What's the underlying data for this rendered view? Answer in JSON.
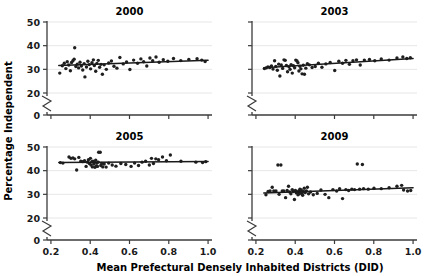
{
  "figure": {
    "xlabel": "Mean Prefectural Densely Inhabited Districts (DID)",
    "ylabel": "Percentage Independent",
    "xtick_labels": [
      "0.2",
      "0.4",
      "0.6",
      "0.8",
      "1.0"
    ],
    "ytick_labels": [
      "0",
      "20",
      "30",
      "40",
      "50"
    ],
    "axis_break": true,
    "colors": {
      "point": "#1f1f1f",
      "fitline": "#1a1a1a",
      "grid": "#e3e3e3",
      "axis": "#3b3b3b",
      "background": "#ffffff"
    }
  },
  "chart_data": [
    {
      "type": "scatter",
      "title": "2000",
      "xlabel": "Mean Prefectural Densely Inhabited Districts (DID)",
      "ylabel": "Percentage Independent",
      "xlim": [
        0.18,
        1.02
      ],
      "ylim": [
        20,
        50
      ],
      "yticks": [
        20,
        30,
        40,
        50
      ],
      "xticks": [
        0.2,
        0.4,
        0.6,
        0.8,
        1.0
      ],
      "grid": true,
      "legend": "none",
      "points": [
        [
          0.245,
          28.4
        ],
        [
          0.258,
          31.5
        ],
        [
          0.268,
          32.6
        ],
        [
          0.276,
          30.3
        ],
        [
          0.283,
          33.2
        ],
        [
          0.291,
          31.8
        ],
        [
          0.299,
          29.4
        ],
        [
          0.305,
          32.9
        ],
        [
          0.312,
          33.6
        ],
        [
          0.318,
          34.3
        ],
        [
          0.321,
          39.1
        ],
        [
          0.327,
          31.2
        ],
        [
          0.334,
          32.2
        ],
        [
          0.341,
          30.6
        ],
        [
          0.348,
          33.0
        ],
        [
          0.355,
          31.4
        ],
        [
          0.362,
          29.7
        ],
        [
          0.369,
          32.4
        ],
        [
          0.373,
          26.8
        ],
        [
          0.381,
          31.0
        ],
        [
          0.388,
          33.4
        ],
        [
          0.395,
          32.0
        ],
        [
          0.402,
          30.2
        ],
        [
          0.409,
          32.8
        ],
        [
          0.416,
          34.0
        ],
        [
          0.421,
          31.6
        ],
        [
          0.428,
          29.2
        ],
        [
          0.434,
          32.5
        ],
        [
          0.441,
          33.8
        ],
        [
          0.448,
          30.9
        ],
        [
          0.455,
          32.1
        ],
        [
          0.462,
          27.9
        ],
        [
          0.471,
          31.9
        ],
        [
          0.482,
          30.0
        ],
        [
          0.494,
          32.7
        ],
        [
          0.508,
          33.5
        ],
        [
          0.521,
          31.3
        ],
        [
          0.536,
          30.5
        ],
        [
          0.551,
          35.0
        ],
        [
          0.568,
          32.3
        ],
        [
          0.585,
          33.1
        ],
        [
          0.602,
          29.9
        ],
        [
          0.621,
          33.9
        ],
        [
          0.641,
          32.6
        ],
        [
          0.658,
          34.4
        ],
        [
          0.672,
          33.2
        ],
        [
          0.688,
          31.4
        ],
        [
          0.704,
          34.8
        ],
        [
          0.718,
          33.6
        ],
        [
          0.735,
          35.2
        ],
        [
          0.751,
          33.0
        ],
        [
          0.772,
          34.1
        ],
        [
          0.795,
          33.4
        ],
        [
          0.824,
          34.6
        ],
        [
          0.861,
          33.7
        ],
        [
          0.902,
          34.2
        ],
        [
          0.944,
          34.5
        ],
        [
          0.968,
          33.9
        ],
        [
          0.985,
          33.3
        ]
      ],
      "fit_line": {
        "x0": 0.24,
        "y0": 31.6,
        "x1": 1.0,
        "y1": 33.8
      }
    },
    {
      "type": "scatter",
      "title": "2003",
      "xlabel": "Mean Prefectural Densely Inhabited Districts (DID)",
      "ylabel": "Percentage Independent",
      "xlim": [
        0.18,
        1.02
      ],
      "ylim": [
        20,
        50
      ],
      "yticks": [
        20,
        30,
        40,
        50
      ],
      "xticks": [
        0.2,
        0.4,
        0.6,
        0.8,
        1.0
      ],
      "grid": true,
      "legend": "none",
      "points": [
        [
          0.243,
          30.3
        ],
        [
          0.252,
          30.6
        ],
        [
          0.261,
          31.0
        ],
        [
          0.271,
          30.8
        ],
        [
          0.279,
          31.4
        ],
        [
          0.287,
          30.1
        ],
        [
          0.295,
          33.6
        ],
        [
          0.301,
          31.2
        ],
        [
          0.309,
          29.6
        ],
        [
          0.316,
          32.2
        ],
        [
          0.322,
          27.2
        ],
        [
          0.329,
          31.8
        ],
        [
          0.336,
          30.4
        ],
        [
          0.343,
          34.0
        ],
        [
          0.349,
          33.8
        ],
        [
          0.355,
          31.6
        ],
        [
          0.361,
          29.0
        ],
        [
          0.368,
          31.1
        ],
        [
          0.374,
          30.0
        ],
        [
          0.379,
          32.0
        ],
        [
          0.385,
          28.4
        ],
        [
          0.391,
          31.5
        ],
        [
          0.397,
          30.7
        ],
        [
          0.403,
          33.9
        ],
        [
          0.409,
          33.5
        ],
        [
          0.414,
          32.8
        ],
        [
          0.419,
          29.3
        ],
        [
          0.424,
          31.3
        ],
        [
          0.429,
          30.2
        ],
        [
          0.435,
          28.1
        ],
        [
          0.441,
          31.7
        ],
        [
          0.447,
          27.9
        ],
        [
          0.454,
          30.5
        ],
        [
          0.462,
          32.4
        ],
        [
          0.472,
          31.9
        ],
        [
          0.486,
          30.8
        ],
        [
          0.502,
          31.2
        ],
        [
          0.518,
          32.6
        ],
        [
          0.536,
          30.9
        ],
        [
          0.556,
          32.3
        ],
        [
          0.578,
          32.9
        ],
        [
          0.601,
          29.5
        ],
        [
          0.622,
          33.4
        ],
        [
          0.641,
          32.6
        ],
        [
          0.658,
          33.8
        ],
        [
          0.676,
          32.1
        ],
        [
          0.694,
          33.6
        ],
        [
          0.712,
          34.0
        ],
        [
          0.731,
          31.8
        ],
        [
          0.752,
          33.9
        ],
        [
          0.778,
          34.2
        ],
        [
          0.805,
          33.6
        ],
        [
          0.838,
          34.4
        ],
        [
          0.878,
          33.9
        ],
        [
          0.918,
          34.8
        ],
        [
          0.948,
          35.2
        ],
        [
          0.968,
          34.6
        ],
        [
          0.986,
          34.9
        ]
      ],
      "fit_line": {
        "x0": 0.24,
        "y0": 30.7,
        "x1": 1.0,
        "y1": 34.6
      }
    },
    {
      "type": "scatter",
      "title": "2005",
      "xlabel": "Mean Prefectural Densely Inhabited Districts (DID)",
      "ylabel": "Percentage Independent",
      "xlim": [
        0.18,
        1.02
      ],
      "ylim": [
        20,
        50
      ],
      "yticks": [
        20,
        30,
        40,
        50
      ],
      "xticks": [
        0.2,
        0.4,
        0.6,
        0.8,
        1.0
      ],
      "grid": true,
      "legend": "none",
      "points": [
        [
          0.248,
          43.4
        ],
        [
          0.261,
          43.2
        ],
        [
          0.292,
          45.8
        ],
        [
          0.302,
          45.2
        ],
        [
          0.312,
          45.4
        ],
        [
          0.321,
          45.0
        ],
        [
          0.331,
          40.3
        ],
        [
          0.342,
          45.6
        ],
        [
          0.352,
          44.0
        ],
        [
          0.362,
          43.8
        ],
        [
          0.371,
          44.2
        ],
        [
          0.379,
          41.8
        ],
        [
          0.386,
          43.6
        ],
        [
          0.391,
          44.6
        ],
        [
          0.396,
          43.0
        ],
        [
          0.401,
          45.2
        ],
        [
          0.404,
          42.4
        ],
        [
          0.408,
          43.8
        ],
        [
          0.411,
          41.6
        ],
        [
          0.414,
          44.0
        ],
        [
          0.418,
          42.8
        ],
        [
          0.421,
          43.4
        ],
        [
          0.424,
          41.4
        ],
        [
          0.428,
          44.4
        ],
        [
          0.431,
          42.0
        ],
        [
          0.434,
          43.2
        ],
        [
          0.437,
          41.8
        ],
        [
          0.441,
          43.6
        ],
        [
          0.443,
          47.8
        ],
        [
          0.451,
          47.8
        ],
        [
          0.454,
          42.2
        ],
        [
          0.459,
          43.0
        ],
        [
          0.464,
          41.6
        ],
        [
          0.471,
          42.8
        ],
        [
          0.481,
          41.5
        ],
        [
          0.494,
          43.2
        ],
        [
          0.512,
          42.4
        ],
        [
          0.531,
          41.9
        ],
        [
          0.556,
          43.0
        ],
        [
          0.581,
          42.6
        ],
        [
          0.608,
          41.8
        ],
        [
          0.626,
          43.2
        ],
        [
          0.646,
          42.2
        ],
        [
          0.664,
          43.6
        ],
        [
          0.682,
          44.0
        ],
        [
          0.701,
          42.4
        ],
        [
          0.712,
          45.2
        ],
        [
          0.722,
          43.0
        ],
        [
          0.734,
          45.0
        ],
        [
          0.748,
          44.6
        ],
        [
          0.768,
          45.8
        ],
        [
          0.788,
          44.2
        ],
        [
          0.808,
          46.6
        ],
        [
          0.862,
          44.0
        ],
        [
          0.938,
          43.6
        ],
        [
          0.972,
          43.4
        ],
        [
          0.988,
          43.8
        ]
      ],
      "fit_line": {
        "x0": 0.24,
        "y0": 43.5,
        "x1": 1.0,
        "y1": 43.9
      }
    },
    {
      "type": "scatter",
      "title": "2009",
      "xlabel": "Mean Prefectural Densely Inhabited Districts (DID)",
      "ylabel": "Percentage Independent",
      "xlim": [
        0.18,
        1.02
      ],
      "ylim": [
        20,
        50
      ],
      "yticks": [
        20,
        30,
        40,
        50
      ],
      "xticks": [
        0.2,
        0.4,
        0.6,
        0.8,
        1.0
      ],
      "grid": true,
      "legend": "none",
      "points": [
        [
          0.251,
          29.8
        ],
        [
          0.262,
          31.2
        ],
        [
          0.272,
          31.4
        ],
        [
          0.283,
          33.0
        ],
        [
          0.291,
          31.4
        ],
        [
          0.302,
          31.4
        ],
        [
          0.312,
          42.4
        ],
        [
          0.318,
          30.0
        ],
        [
          0.327,
          42.4
        ],
        [
          0.334,
          31.4
        ],
        [
          0.342,
          31.4
        ],
        [
          0.351,
          28.6
        ],
        [
          0.359,
          31.6
        ],
        [
          0.366,
          33.4
        ],
        [
          0.372,
          31.0
        ],
        [
          0.378,
          30.2
        ],
        [
          0.385,
          32.0
        ],
        [
          0.391,
          31.2
        ],
        [
          0.396,
          27.8
        ],
        [
          0.401,
          31.6
        ],
        [
          0.406,
          30.6
        ],
        [
          0.411,
          31.0
        ],
        [
          0.414,
          29.8
        ],
        [
          0.418,
          31.4
        ],
        [
          0.421,
          30.2
        ],
        [
          0.424,
          32.2
        ],
        [
          0.427,
          30.8
        ],
        [
          0.431,
          31.8
        ],
        [
          0.434,
          30.4
        ],
        [
          0.438,
          29.6
        ],
        [
          0.442,
          31.2
        ],
        [
          0.446,
          32.6
        ],
        [
          0.451,
          30.8
        ],
        [
          0.457,
          31.4
        ],
        [
          0.462,
          33.0
        ],
        [
          0.468,
          30.2
        ],
        [
          0.478,
          31.0
        ],
        [
          0.492,
          29.8
        ],
        [
          0.512,
          30.4
        ],
        [
          0.531,
          31.8
        ],
        [
          0.552,
          30.0
        ],
        [
          0.571,
          28.6
        ],
        [
          0.592,
          32.0
        ],
        [
          0.611,
          31.4
        ],
        [
          0.626,
          32.4
        ],
        [
          0.641,
          28.2
        ],
        [
          0.658,
          32.0
        ],
        [
          0.672,
          31.6
        ],
        [
          0.688,
          32.2
        ],
        [
          0.702,
          32.0
        ],
        [
          0.716,
          42.8
        ],
        [
          0.728,
          32.2
        ],
        [
          0.742,
          42.6
        ],
        [
          0.748,
          32.4
        ],
        [
          0.772,
          32.2
        ],
        [
          0.801,
          32.6
        ],
        [
          0.838,
          32.4
        ],
        [
          0.878,
          32.8
        ],
        [
          0.918,
          33.4
        ],
        [
          0.942,
          33.8
        ],
        [
          0.952,
          31.8
        ],
        [
          0.972,
          31.4
        ],
        [
          0.988,
          31.6
        ]
      ],
      "fit_line": {
        "x0": 0.24,
        "y0": 30.6,
        "x1": 1.0,
        "y1": 32.8
      }
    }
  ]
}
